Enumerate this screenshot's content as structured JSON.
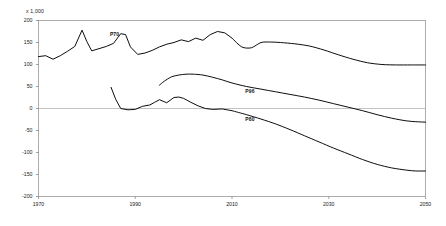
{
  "chart_data": {
    "type": "line",
    "title": "",
    "subtitle": "",
    "unit_label": "x 1,000",
    "xlabel": "",
    "ylabel": "",
    "xlim": [
      1970,
      2050
    ],
    "ylim": [
      -200,
      200
    ],
    "grid": false,
    "zero_line": true,
    "legend_position": "inline-annotations",
    "xticks": [
      "1970",
      "1990",
      "2010",
      "2030",
      "2050"
    ],
    "xtick_values": [
      1970,
      1990,
      2010,
      2030,
      2050
    ],
    "yticks": [
      "200",
      "150",
      "100",
      "50",
      "0",
      "-50",
      "-100",
      "-150",
      "-200"
    ],
    "ytick_values": [
      200,
      150,
      100,
      50,
      0,
      -50,
      -100,
      -150,
      -200
    ],
    "annotations": [
      {
        "text": "P70",
        "x": 1986,
        "y": 168
      },
      {
        "text": "P96",
        "x": 2014,
        "y": 38
      },
      {
        "text": "P80",
        "x": 2014,
        "y": -25
      }
    ],
    "series": [
      {
        "name": "P70",
        "label": "P70",
        "x": [
          1970,
          1971.5,
          1973,
          1974.5,
          1976,
          1977.5,
          1979,
          1980,
          1981,
          1982.5,
          1984,
          1985.5,
          1987,
          1988,
          1989,
          1990.5,
          1992,
          1993.5,
          1995,
          1996.5,
          1998,
          1999.5,
          2001,
          2002.5,
          2004,
          2005.5,
          2007,
          2008.5,
          2010,
          2012,
          2014,
          2016,
          2018,
          2020,
          2023,
          2026,
          2029,
          2032,
          2035,
          2038,
          2041,
          2044,
          2047,
          2050
        ],
        "values": [
          118,
          120,
          112,
          120,
          130,
          141,
          178,
          152,
          131,
          136,
          141,
          148,
          170,
          168,
          140,
          123,
          126,
          132,
          140,
          146,
          150,
          156,
          152,
          160,
          155,
          168,
          175,
          172,
          160,
          140,
          138,
          150,
          151,
          150,
          147,
          142,
          133,
          122,
          112,
          104,
          100,
          99,
          99,
          99
        ]
      },
      {
        "name": "P96",
        "label": "P96",
        "x": [
          1995,
          1996,
          1997.5,
          1999,
          2000.5,
          2002,
          2004,
          2006,
          2008,
          2010,
          2013,
          2016,
          2019,
          2022,
          2025,
          2028,
          2031,
          2034,
          2037,
          2040,
          2043,
          2046,
          2048,
          2050
        ],
        "values": [
          53,
          62,
          72,
          76,
          78,
          78,
          76,
          71,
          65,
          58,
          50,
          44,
          38,
          32,
          26,
          19,
          11,
          3,
          -5,
          -14,
          -22,
          -28,
          -30,
          -31
        ]
      },
      {
        "name": "P80",
        "label": "P80",
        "x": [
          1985,
          1986,
          1987,
          1988.5,
          1990,
          1991.5,
          1993,
          1994,
          1995,
          1996.5,
          1998,
          1999,
          2000,
          2001.5,
          2003,
          2004.5,
          2006,
          2008,
          2010,
          2013,
          2016,
          2019,
          2022,
          2025,
          2028,
          2031,
          2034,
          2037,
          2040,
          2043,
          2046,
          2048,
          2050
        ],
        "values": [
          48,
          20,
          0,
          -3,
          -2,
          5,
          8,
          14,
          20,
          13,
          25,
          26,
          23,
          14,
          6,
          0,
          -2,
          -1,
          -5,
          -14,
          -24,
          -35,
          -48,
          -62,
          -76,
          -90,
          -103,
          -116,
          -127,
          -135,
          -140,
          -142,
          -142
        ]
      }
    ]
  }
}
